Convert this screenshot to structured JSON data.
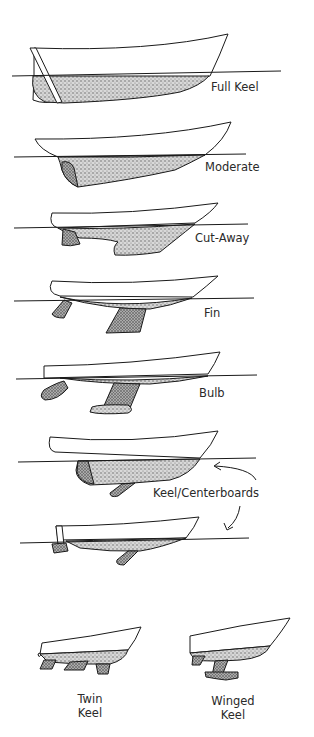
{
  "diagram": {
    "title": "",
    "colors": {
      "ink": "#1a1a1a",
      "stipple": "#6b6b6b",
      "paper": "#ffffff"
    },
    "keel_types": [
      {
        "id": "full-keel",
        "label": "Full Keel"
      },
      {
        "id": "moderate",
        "label": "Moderate"
      },
      {
        "id": "cut-away",
        "label": "Cut-Away"
      },
      {
        "id": "fin",
        "label": "Fin"
      },
      {
        "id": "bulb",
        "label": "Bulb"
      },
      {
        "id": "keel-centerboard-1",
        "label": "Keel/Centerboards"
      },
      {
        "id": "keel-centerboard-2",
        "label": ""
      },
      {
        "id": "twin-keel",
        "label_line1": "Twin",
        "label_line2": "Keel"
      },
      {
        "id": "winged-keel",
        "label_line1": "Winged",
        "label_line2": "Keel"
      }
    ]
  }
}
